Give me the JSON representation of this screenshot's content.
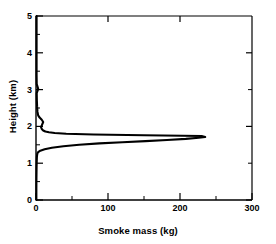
{
  "chart_data": {
    "type": "line",
    "title": "",
    "subtitle": "",
    "xlabel": "Smoke mass (kg)",
    "ylabel": "Height (km)",
    "xlim": [
      0,
      300
    ],
    "ylim": [
      0,
      5
    ],
    "xticks": [
      0,
      100,
      200,
      300
    ],
    "xtick_labels": [
      "0",
      "100",
      "200",
      "300"
    ],
    "xminor_ticks": [
      50,
      150,
      250
    ],
    "yticks": [
      0,
      1,
      2,
      3,
      4,
      5
    ],
    "ytick_labels": [
      "0",
      "1",
      "2",
      "3",
      "4",
      "5"
    ],
    "yminor_ticks": [
      0.5,
      1.5,
      2.5,
      3.5,
      4.5
    ],
    "grid": false,
    "legend": false,
    "legend_position": "none",
    "line_color": "#000000",
    "axis_color": "#000000",
    "background_color": "#ffffff",
    "orientation": "vertical-profile",
    "series": [
      {
        "name": "Smoke mass profile",
        "x": [
          0.5,
          0.5,
          0.6,
          0.8,
          1.0,
          1.2,
          1.5,
          2.0,
          3.0,
          6.0,
          12.0,
          22.0,
          38.0,
          60.0,
          88.0,
          120.0,
          152.0,
          182.0,
          208.0,
          226.0,
          235.0,
          230.0,
          150.0,
          80.0,
          42.0,
          26.0,
          18.0,
          13.0,
          10.0,
          8.0,
          7.0,
          8.5,
          10.0,
          8.0,
          5.0,
          3.0,
          2.0,
          1.5,
          1.2,
          1.0,
          3.0,
          1.0,
          0.8,
          0.8,
          0.8,
          0.8
        ],
        "y": [
          0.0,
          0.3,
          0.6,
          0.9,
          1.05,
          1.15,
          1.22,
          1.27,
          1.3,
          1.34,
          1.38,
          1.42,
          1.46,
          1.5,
          1.54,
          1.57,
          1.6,
          1.63,
          1.66,
          1.69,
          1.71,
          1.74,
          1.76,
          1.78,
          1.8,
          1.82,
          1.84,
          1.86,
          1.89,
          1.93,
          1.98,
          2.05,
          2.12,
          2.18,
          2.24,
          2.3,
          2.4,
          2.55,
          2.7,
          2.9,
          3.02,
          3.15,
          3.4,
          3.8,
          4.4,
          5.0
        ]
      }
    ],
    "peak": {
      "value": 235,
      "height": 1.71,
      "units": "kg"
    }
  }
}
